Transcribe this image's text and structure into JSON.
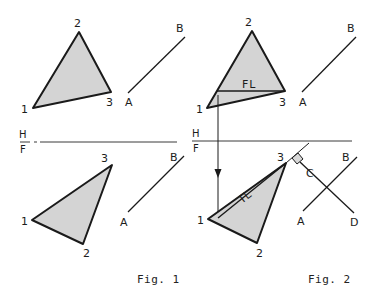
{
  "figures": [
    {
      "caption": "Fig. 1",
      "fold_line": {
        "top_label": "H",
        "bottom_label": "F"
      },
      "top_view": {
        "vertices": {
          "1": "1",
          "2": "2",
          "3": "3"
        },
        "line": {
          "start": "A",
          "end": "B"
        }
      },
      "front_view": {
        "vertices": {
          "1": "1",
          "2": "2",
          "3": "3"
        },
        "line": {
          "start": "A",
          "end": "B"
        }
      }
    },
    {
      "caption": "Fig. 2",
      "fold_line": {
        "top_label": "H",
        "bottom_label": "F"
      },
      "top_view": {
        "vertices": {
          "1": "1",
          "2": "2",
          "3": "3"
        },
        "line": {
          "start": "A",
          "end": "B"
        },
        "annotation": "FL"
      },
      "front_view": {
        "vertices": {
          "1": "1",
          "2": "2",
          "3": "3"
        },
        "line": {
          "start": "A",
          "end": "B"
        },
        "perpendicular": {
          "start": "C",
          "end": "D"
        },
        "annotation": "TL"
      }
    }
  ],
  "colors": {
    "line": "#1a1a1a",
    "fill": "#d4d4d4",
    "background": "#ffffff"
  }
}
